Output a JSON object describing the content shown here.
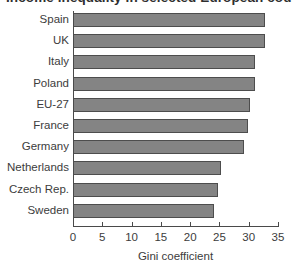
{
  "figure": {
    "title_clipped": "Income inequality in selected European countries",
    "title_visible": false
  },
  "chart_data": {
    "type": "bar",
    "orientation": "horizontal",
    "title": "",
    "xlabel": "Gini coefficient",
    "ylabel": "",
    "xlim": [
      0,
      35
    ],
    "xticks": [
      0,
      5,
      10,
      15,
      20,
      25,
      30,
      35
    ],
    "grid": false,
    "legend": null,
    "bar_color": "#848484",
    "bar_edge_color": "#4d4d4d",
    "categories": [
      "Spain",
      "UK",
      "Italy",
      "Poland",
      "EU-27",
      "France",
      "Germany",
      "Netherlands",
      "Czech Rep.",
      "Sweden"
    ],
    "values": [
      32.8,
      32.8,
      31.0,
      31.0,
      30.3,
      29.8,
      29.2,
      25.3,
      24.8,
      24.0
    ]
  }
}
